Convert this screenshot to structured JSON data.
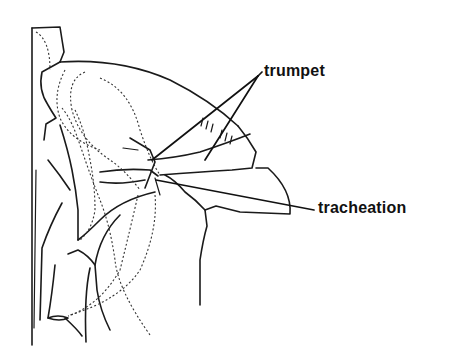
{
  "figure": {
    "labels": {
      "trumpet": "trumpet",
      "tracheation": "tracheation"
    },
    "colors": {
      "ink": "#1a1a1a",
      "background": "#ffffff"
    }
  }
}
